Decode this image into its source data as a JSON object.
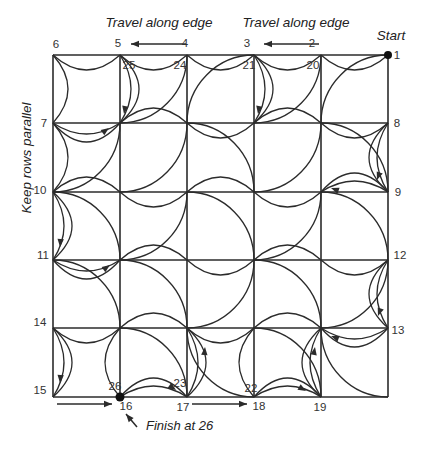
{
  "labels": {
    "travel_edge_left": "Travel along edge",
    "travel_edge_right": "Travel along edge",
    "start": "Start",
    "keep_rows_parallel": "Keep rows parallel",
    "finish": "Finish at 26"
  },
  "diagram": {
    "background": "#ffffff",
    "stroke_color": "#2b2b2b",
    "text_color": "#333333",
    "grid": {
      "cols": [
        53,
        120,
        187,
        254,
        321,
        388
      ],
      "rows": [
        55,
        123,
        192,
        260,
        328,
        397
      ]
    },
    "annotation_positions": {
      "travel_edge_left": {
        "x": 159,
        "y": 27
      },
      "travel_edge_right": {
        "x": 296,
        "y": 27
      },
      "start": {
        "x": 391,
        "y": 40
      },
      "keep_rows_parallel": {
        "x": 31,
        "y": 158
      },
      "finish": {
        "x": 146,
        "y": 430
      }
    },
    "point_labels": [
      {
        "t": "6",
        "x": 56,
        "y": 48
      },
      {
        "t": "5",
        "x": 118,
        "y": 47
      },
      {
        "t": "4",
        "x": 185,
        "y": 47
      },
      {
        "t": "3",
        "x": 247,
        "y": 47
      },
      {
        "t": "2",
        "x": 312,
        "y": 47
      },
      {
        "t": "1",
        "x": 397,
        "y": 59
      },
      {
        "t": "25",
        "x": 129,
        "y": 69
      },
      {
        "t": "24",
        "x": 180,
        "y": 69
      },
      {
        "t": "21",
        "x": 249,
        "y": 69
      },
      {
        "t": "20",
        "x": 313,
        "y": 69
      },
      {
        "t": "7",
        "x": 44,
        "y": 127
      },
      {
        "t": "10",
        "x": 40,
        "y": 194
      },
      {
        "t": "11",
        "x": 43,
        "y": 259
      },
      {
        "t": "14",
        "x": 40,
        "y": 326
      },
      {
        "t": "15",
        "x": 40,
        "y": 394
      },
      {
        "t": "8",
        "x": 397,
        "y": 127
      },
      {
        "t": "9",
        "x": 398,
        "y": 196
      },
      {
        "t": "12",
        "x": 400,
        "y": 259
      },
      {
        "t": "13",
        "x": 398,
        "y": 334
      },
      {
        "t": "16",
        "x": 126,
        "y": 410
      },
      {
        "t": "17",
        "x": 183,
        "y": 411
      },
      {
        "t": "18",
        "x": 259,
        "y": 410
      },
      {
        "t": "19",
        "x": 320,
        "y": 411
      },
      {
        "t": "26",
        "x": 115,
        "y": 390
      },
      {
        "t": "23",
        "x": 180,
        "y": 387
      },
      {
        "t": "22",
        "x": 251,
        "y": 392
      }
    ],
    "quarter_arcs": [
      {
        "r": 1,
        "c": 2,
        "center": "TL"
      },
      {
        "r": 1,
        "c": 3,
        "center": "BR"
      },
      {
        "r": 1,
        "c": 4,
        "center": "TL"
      },
      {
        "r": 1,
        "c": 5,
        "center": "BR"
      },
      {
        "r": 2,
        "c": 1,
        "center": "TL"
      },
      {
        "r": 2,
        "c": 2,
        "center": "TL"
      },
      {
        "r": 2,
        "c": 3,
        "center": "BL"
      },
      {
        "r": 2,
        "c": 4,
        "center": "TL"
      },
      {
        "r": 2,
        "c": 5,
        "center": "BL"
      },
      {
        "r": 3,
        "c": 1,
        "center": "BL"
      },
      {
        "r": 3,
        "c": 2,
        "center": "TL"
      },
      {
        "r": 3,
        "c": 3,
        "center": "BL"
      },
      {
        "r": 3,
        "c": 4,
        "center": "TL"
      },
      {
        "r": 3,
        "c": 5,
        "center": "BL"
      },
      {
        "r": 4,
        "c": 1,
        "center": "BL"
      },
      {
        "r": 4,
        "c": 2,
        "center": "BL"
      },
      {
        "r": 4,
        "c": 3,
        "center": "TL"
      },
      {
        "r": 4,
        "c": 4,
        "center": "BL"
      },
      {
        "r": 4,
        "c": 5,
        "center": "TL"
      },
      {
        "r": 5,
        "c": 2,
        "center": "BL"
      },
      {
        "r": 5,
        "c": 3,
        "center": "TR"
      },
      {
        "r": 5,
        "c": 4,
        "center": "BL"
      },
      {
        "r": 5,
        "c": 5,
        "center": "TR"
      }
    ],
    "edge_arcs": [
      {
        "type": "h",
        "line": 0,
        "cell": 1,
        "side": "D"
      },
      {
        "type": "h",
        "line": 0,
        "cell": 2,
        "side": "D"
      },
      {
        "type": "h",
        "line": 0,
        "cell": 3,
        "side": "D"
      },
      {
        "type": "h",
        "line": 0,
        "cell": 4,
        "side": "D"
      },
      {
        "type": "h",
        "line": 0,
        "cell": 5,
        "side": "D"
      },
      {
        "type": "h",
        "line": 1,
        "cell": 1,
        "side": "D",
        "dbl": true
      },
      {
        "type": "h",
        "line": 1,
        "cell": 2,
        "side": "U"
      },
      {
        "type": "h",
        "line": 1,
        "cell": 3,
        "side": "D"
      },
      {
        "type": "h",
        "line": 1,
        "cell": 4,
        "side": "U"
      },
      {
        "type": "h",
        "line": 1,
        "cell": 5,
        "side": "D"
      },
      {
        "type": "h",
        "line": 2,
        "cell": 1,
        "side": "U"
      },
      {
        "type": "h",
        "line": 2,
        "cell": 2,
        "side": "D"
      },
      {
        "type": "h",
        "line": 2,
        "cell": 3,
        "side": "U"
      },
      {
        "type": "h",
        "line": 2,
        "cell": 4,
        "side": "D"
      },
      {
        "type": "h",
        "line": 2,
        "cell": 5,
        "side": "U",
        "dbl": true
      },
      {
        "type": "h",
        "line": 3,
        "cell": 1,
        "side": "D",
        "dbl": true
      },
      {
        "type": "h",
        "line": 3,
        "cell": 2,
        "side": "U"
      },
      {
        "type": "h",
        "line": 3,
        "cell": 3,
        "side": "D"
      },
      {
        "type": "h",
        "line": 3,
        "cell": 4,
        "side": "U"
      },
      {
        "type": "h",
        "line": 3,
        "cell": 5,
        "side": "D"
      },
      {
        "type": "h",
        "line": 4,
        "cell": 1,
        "side": "D"
      },
      {
        "type": "h",
        "line": 4,
        "cell": 2,
        "side": "U"
      },
      {
        "type": "h",
        "line": 4,
        "cell": 3,
        "side": "D"
      },
      {
        "type": "h",
        "line": 4,
        "cell": 4,
        "side": "U"
      },
      {
        "type": "h",
        "line": 4,
        "cell": 5,
        "side": "D",
        "dbl": true
      },
      {
        "type": "h",
        "line": 5,
        "cell": 2,
        "side": "U",
        "dbl": true
      },
      {
        "type": "h",
        "line": 5,
        "cell": 4,
        "side": "U",
        "dbl": true
      },
      {
        "type": "v",
        "line": 0,
        "cell": 1,
        "side": "R"
      },
      {
        "type": "v",
        "line": 0,
        "cell": 2,
        "side": "R"
      },
      {
        "type": "v",
        "line": 0,
        "cell": 3,
        "side": "R",
        "dbl": true
      },
      {
        "type": "v",
        "line": 0,
        "cell": 5,
        "side": "R",
        "dbl": true
      },
      {
        "type": "v",
        "line": 5,
        "cell": 2,
        "side": "L",
        "dbl": true
      },
      {
        "type": "v",
        "line": 5,
        "cell": 4,
        "side": "L",
        "dbl": true
      },
      {
        "type": "v",
        "line": 1,
        "cell": 1,
        "side": "R",
        "dbl": true
      },
      {
        "type": "v",
        "line": 3,
        "cell": 1,
        "side": "R",
        "dbl": true
      },
      {
        "type": "v",
        "line": 1,
        "cell": 5,
        "side": "L"
      },
      {
        "type": "v",
        "line": 2,
        "cell": 5,
        "side": "R",
        "dbl": true
      },
      {
        "type": "v",
        "line": 3,
        "cell": 5,
        "side": "L"
      },
      {
        "type": "v",
        "line": 4,
        "cell": 5,
        "side": "L",
        "dbl": true
      }
    ],
    "straight_arrows": [
      {
        "x1": 186,
        "y1": 44,
        "x2": 131,
        "y2": 44
      },
      {
        "x1": 319,
        "y1": 44,
        "x2": 264,
        "y2": 44
      },
      {
        "x1": 57,
        "y1": 404,
        "x2": 112,
        "y2": 404
      },
      {
        "x1": 192,
        "y1": 404,
        "x2": 247,
        "y2": 404
      },
      {
        "x1": 137,
        "y1": 427,
        "x2": 126,
        "y2": 414
      }
    ],
    "arc_arrowheads": [
      {
        "x": 124,
        "y": 114,
        "angle": 100
      },
      {
        "x": 109,
        "y": 128,
        "angle": -35
      },
      {
        "x": 258,
        "y": 114,
        "angle": 100
      },
      {
        "x": 377,
        "y": 180,
        "angle": 110
      },
      {
        "x": 331,
        "y": 188,
        "angle": 200
      },
      {
        "x": 60,
        "y": 247,
        "angle": 95
      },
      {
        "x": 110,
        "y": 265,
        "angle": -35
      },
      {
        "x": 378,
        "y": 316,
        "angle": 110
      },
      {
        "x": 331,
        "y": 336,
        "angle": 200
      },
      {
        "x": 60,
        "y": 383,
        "angle": 95
      },
      {
        "x": 176,
        "y": 390,
        "angle": 35
      },
      {
        "x": 205,
        "y": 347,
        "angle": -85
      },
      {
        "x": 306,
        "y": 391,
        "angle": 30
      },
      {
        "x": 315,
        "y": 347,
        "angle": -80
      }
    ],
    "dots": [
      {
        "x": 388,
        "y": 55,
        "r": 4,
        "name": "start-dot"
      },
      {
        "x": 120,
        "y": 397,
        "r": 4.5,
        "name": "finish-dot"
      }
    ]
  }
}
